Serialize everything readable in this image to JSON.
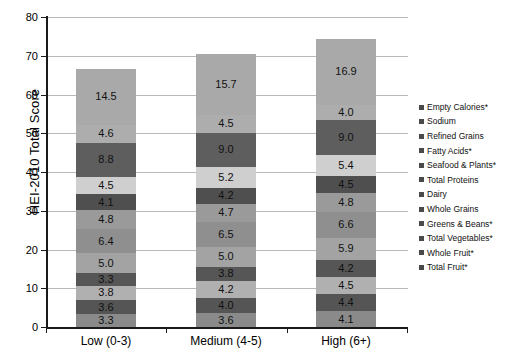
{
  "chart_data": {
    "type": "bar",
    "subtype": "stacked-bar",
    "title": "",
    "xlabel": "",
    "ylabel": "HEI-2010 Total Score",
    "ylim": [
      0,
      80
    ],
    "yticks": [
      0,
      10,
      20,
      30,
      40,
      50,
      60,
      70,
      80
    ],
    "grid": true,
    "legend_position": "right",
    "categories": [
      "Low (0-3)",
      "Medium (4-5)",
      "High (6+)"
    ],
    "totals": [
      66.9,
      70.4,
      74.3
    ],
    "stack_order_bottom_to_top": [
      "Total Fruit*",
      "Whole Fruit*",
      "Total Vegetables*",
      "Greens & Beans*",
      "Whole Grains",
      "Dairy",
      "Total Proteins",
      "Seafood & Plants*",
      "Fatty Acids*",
      "Refined Grains",
      "Sodium",
      "Empty Calories*"
    ],
    "series": [
      {
        "name": "Empty Calories*",
        "color": "#a9a9a9",
        "values": [
          14.5,
          15.7,
          16.9
        ]
      },
      {
        "name": "Sodium",
        "color": "#adadad",
        "values": [
          4.6,
          4.5,
          4.0
        ]
      },
      {
        "name": "Refined Grains",
        "color": "#5e5e5e",
        "values": [
          8.8,
          9.0,
          9.0
        ]
      },
      {
        "name": "Fatty Acids*",
        "color": "#cfcfcf",
        "values": [
          4.5,
          5.2,
          5.4
        ]
      },
      {
        "name": "Seafood & Plants*",
        "color": "#4f4f4f",
        "values": [
          4.1,
          4.2,
          4.5
        ]
      },
      {
        "name": "Total Proteins",
        "color": "#9a9a9a",
        "values": [
          4.8,
          4.7,
          4.8
        ]
      },
      {
        "name": "Dairy",
        "color": "#8f8f8f",
        "values": [
          6.4,
          6.5,
          6.6
        ]
      },
      {
        "name": "Whole Grains",
        "color": "#a3a3a3",
        "values": [
          5.0,
          5.0,
          5.9
        ]
      },
      {
        "name": "Greens & Beans*",
        "color": "#565656",
        "values": [
          3.3,
          3.8,
          4.2
        ]
      },
      {
        "name": "Total Vegetables*",
        "color": "#b0b0b0",
        "values": [
          3.8,
          4.2,
          4.5
        ]
      },
      {
        "name": "Whole Fruit*",
        "color": "#555555",
        "values": [
          3.6,
          4.0,
          4.4
        ]
      },
      {
        "name": "Total Fruit*",
        "color": "#8a8a8a",
        "values": [
          3.3,
          3.6,
          4.1
        ]
      }
    ],
    "legend_entries": [
      "Empty Calories*",
      "Sodium",
      "Refined Grains",
      "Fatty Acids*",
      "Seafood & Plants*",
      "Total Proteins",
      "Dairy",
      "Whole Grains",
      "Greens & Beans*",
      "Total Vegetables*",
      "Whole Fruit*",
      "Total Fruit*"
    ],
    "data_labels": {
      "Low (0-3)": [
        "14.5",
        "4.6",
        "8.8",
        "4.5",
        "4.1",
        "4.8",
        "6.4",
        "5.0",
        "3.3",
        "3.8",
        "3.6",
        "3.3"
      ],
      "Medium (4-5)": [
        "15.7",
        "4.5",
        "9.0",
        "5.2",
        "4.2",
        "4.7",
        "6.5",
        "5.0",
        "3.8",
        "4.2",
        "4.0",
        "3.6"
      ],
      "High (6+)": [
        "16.9",
        "4.0",
        "9.0",
        "5.4",
        "4.5",
        "4.8",
        "6.6",
        "5.9",
        "4.2",
        "4.5",
        "4.4",
        "4.1"
      ]
    }
  },
  "colors": {
    "axis": "#1a1a1a",
    "grid": "#b9b9b9",
    "background": "#ffffff",
    "legend_swatch": "#4a4a4a"
  }
}
